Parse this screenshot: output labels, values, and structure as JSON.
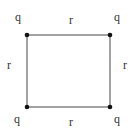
{
  "diagram": {
    "shape": "square",
    "side_label": "r",
    "corners": [
      {
        "label": "q",
        "position": "top-left"
      },
      {
        "label": "q",
        "position": "top-right"
      },
      {
        "label": "q",
        "position": "bottom-left"
      },
      {
        "label": "q",
        "position": "bottom-right"
      }
    ],
    "sides": [
      {
        "label": "r",
        "position": "top"
      },
      {
        "label": "r",
        "position": "left"
      },
      {
        "label": "r",
        "position": "right"
      },
      {
        "label": "r",
        "position": "bottom"
      }
    ],
    "colors": {
      "line": "#555555",
      "dot": "#111111",
      "text": "#333333"
    }
  }
}
